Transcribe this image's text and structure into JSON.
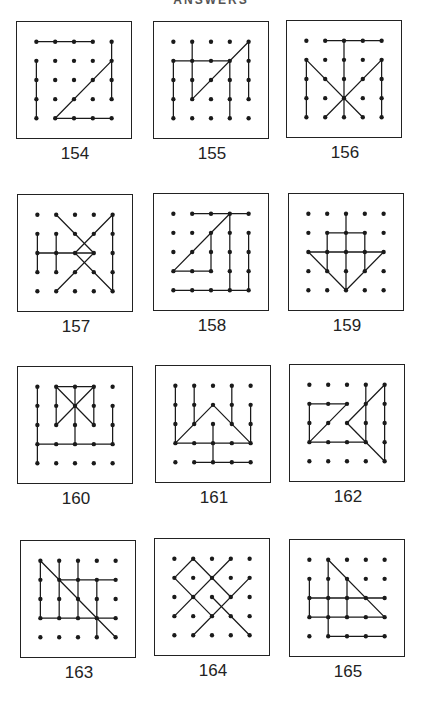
{
  "page": {
    "header": "ANSWERS",
    "colors": {
      "ink": "#1a1a1a",
      "paper": "#ffffff"
    }
  },
  "grid": {
    "cols": 5,
    "rows": 5
  },
  "puzzles": [
    {
      "number": "154",
      "segments": [
        [
          0,
          0,
          3,
          0
        ],
        [
          0,
          1,
          0,
          4
        ],
        [
          4,
          0,
          4,
          3
        ],
        [
          1,
          4,
          4,
          1
        ],
        [
          1,
          4,
          4,
          4
        ]
      ]
    },
    {
      "number": "155",
      "segments": [
        [
          1,
          0,
          1,
          3
        ],
        [
          0,
          1,
          3,
          1
        ],
        [
          0,
          1,
          0,
          4
        ],
        [
          1,
          3,
          4,
          0
        ],
        [
          3,
          1,
          3,
          4
        ],
        [
          4,
          0,
          4,
          3
        ]
      ]
    },
    {
      "number": "156",
      "segments": [
        [
          1,
          0,
          4,
          0
        ],
        [
          2,
          0,
          2,
          4
        ],
        [
          0,
          1,
          0,
          4
        ],
        [
          4,
          1,
          4,
          4
        ],
        [
          0,
          1,
          3,
          4
        ],
        [
          4,
          1,
          1,
          4
        ]
      ]
    },
    {
      "number": "157",
      "segments": [
        [
          0,
          1,
          0,
          3
        ],
        [
          1,
          1,
          1,
          3
        ],
        [
          0,
          2,
          3,
          2
        ],
        [
          1,
          0,
          3,
          2
        ],
        [
          3,
          2,
          1,
          4
        ],
        [
          4,
          0,
          2,
          2
        ],
        [
          2,
          2,
          4,
          4
        ],
        [
          4,
          0,
          4,
          4
        ]
      ]
    },
    {
      "number": "158",
      "segments": [
        [
          1,
          0,
          4,
          0
        ],
        [
          0,
          3,
          3,
          0
        ],
        [
          0,
          3,
          2,
          3
        ],
        [
          2,
          1,
          2,
          3
        ],
        [
          3,
          0,
          3,
          4
        ],
        [
          0,
          4,
          4,
          4
        ],
        [
          4,
          1,
          4,
          4
        ]
      ]
    },
    {
      "number": "159",
      "segments": [
        [
          2,
          0,
          2,
          4
        ],
        [
          1,
          1,
          3,
          1
        ],
        [
          1,
          1,
          1,
          3
        ],
        [
          3,
          1,
          3,
          3
        ],
        [
          0,
          2,
          4,
          2
        ],
        [
          0,
          2,
          2,
          4
        ],
        [
          4,
          2,
          2,
          4
        ]
      ]
    },
    {
      "number": "160",
      "segments": [
        [
          0,
          0,
          0,
          4
        ],
        [
          0,
          3,
          4,
          3
        ],
        [
          1,
          0,
          3,
          0
        ],
        [
          1,
          0,
          1,
          2
        ],
        [
          3,
          0,
          3,
          2
        ],
        [
          1,
          0,
          3,
          2
        ],
        [
          3,
          0,
          1,
          2
        ],
        [
          2,
          0,
          2,
          3
        ],
        [
          4,
          1,
          4,
          3
        ]
      ]
    },
    {
      "number": "161",
      "segments": [
        [
          0,
          0,
          0,
          3
        ],
        [
          1,
          0,
          1,
          2
        ],
        [
          3,
          0,
          3,
          2
        ],
        [
          4,
          1,
          4,
          3
        ],
        [
          0,
          3,
          2,
          1
        ],
        [
          2,
          1,
          4,
          3
        ],
        [
          0,
          3,
          4,
          3
        ],
        [
          2,
          2,
          2,
          4
        ],
        [
          1,
          4,
          4,
          4
        ]
      ]
    },
    {
      "number": "162",
      "segments": [
        [
          0,
          1,
          2,
          1
        ],
        [
          0,
          1,
          0,
          3
        ],
        [
          0,
          3,
          3,
          3
        ],
        [
          0,
          3,
          2,
          1
        ],
        [
          3,
          0,
          3,
          3
        ],
        [
          4,
          0,
          2,
          2
        ],
        [
          2,
          2,
          4,
          4
        ],
        [
          4,
          0,
          4,
          4
        ]
      ]
    },
    {
      "number": "163",
      "segments": [
        [
          0,
          0,
          4,
          4
        ],
        [
          0,
          0,
          0,
          3
        ],
        [
          1,
          0,
          1,
          3
        ],
        [
          2,
          0,
          2,
          3
        ],
        [
          3,
          1,
          3,
          4
        ],
        [
          1,
          1,
          4,
          1
        ],
        [
          0,
          3,
          4,
          3
        ]
      ]
    },
    {
      "number": "164",
      "segments": [
        [
          0,
          1,
          1,
          0
        ],
        [
          1,
          0,
          3,
          2
        ],
        [
          0,
          1,
          2,
          3
        ],
        [
          0,
          3,
          3,
          0
        ],
        [
          1,
          4,
          4,
          1
        ],
        [
          2,
          2,
          4,
          4
        ]
      ]
    },
    {
      "number": "165",
      "segments": [
        [
          1,
          0,
          4,
          3
        ],
        [
          1,
          0,
          1,
          4
        ],
        [
          0,
          1,
          0,
          3
        ],
        [
          2,
          1,
          2,
          3
        ],
        [
          0,
          2,
          4,
          2
        ],
        [
          0,
          3,
          4,
          3
        ],
        [
          1,
          4,
          4,
          4
        ]
      ]
    }
  ]
}
